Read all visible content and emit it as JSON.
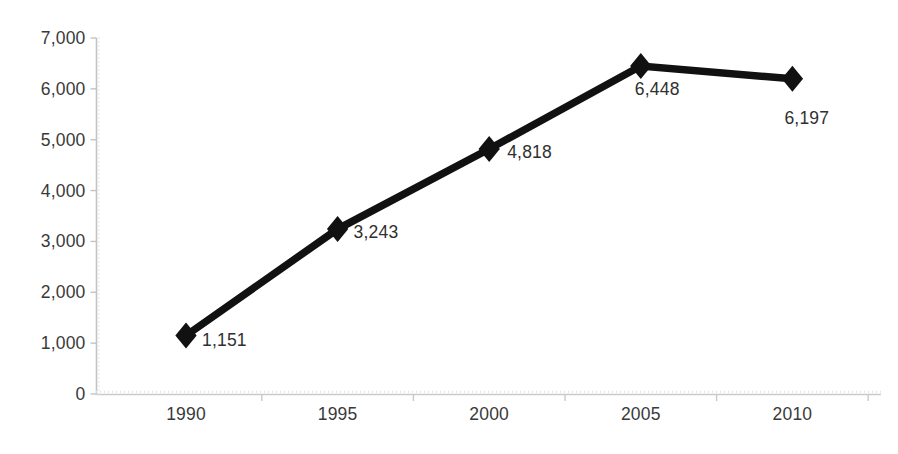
{
  "chart_data": {
    "type": "line",
    "title": "",
    "subtitle": "",
    "xlabel": "",
    "ylabel": "",
    "categories": [
      "1990",
      "1995",
      "2000",
      "2005",
      "2010"
    ],
    "values": [
      1151,
      3243,
      4818,
      6448,
      6197
    ],
    "point_labels": [
      "1,151",
      "3,243",
      "4,818",
      "6,448",
      "6,197"
    ],
    "series": [
      {
        "name": "",
        "values": [
          1151,
          3243,
          4818,
          6448,
          6197
        ]
      }
    ],
    "ylim": [
      0,
      7000
    ],
    "y_tick_step": 1000,
    "y_ticks": [
      0,
      1000,
      2000,
      3000,
      4000,
      5000,
      6000,
      7000
    ],
    "y_tick_labels": [
      "0",
      "1,000",
      "2,000",
      "3,000",
      "4,000",
      "5,000",
      "6,000",
      "7,000"
    ],
    "x_ticks": [
      "1990",
      "1995",
      "2000",
      "2005",
      "2010"
    ],
    "grid": false,
    "legend": false,
    "legend_position": "none",
    "marker": "diamond",
    "line_color": "#111111",
    "marker_color": "#111111",
    "axis_color": "#bdbdbd",
    "text_color": "#3a3a3a",
    "background_color": "#ffffff"
  },
  "axes": {
    "y_axis_name": "value-axis",
    "x_axis_name": "category-axis"
  }
}
